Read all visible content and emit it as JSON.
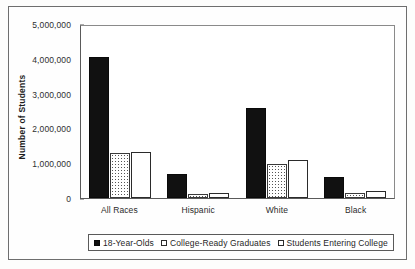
{
  "chart_data": {
    "type": "bar",
    "title": "",
    "subtitle": "",
    "xlabel": "",
    "ylabel": "Number of Students",
    "ylim": [
      0,
      5000000
    ],
    "ytick_labels": [
      "5,000,000",
      "4,000,000",
      "3,000,000",
      "2,000,000",
      "1,000,000",
      "0"
    ],
    "ytick_values": [
      5000000,
      4000000,
      3000000,
      2000000,
      1000000,
      0
    ],
    "grid": false,
    "legend_position": "bottom",
    "categories": [
      "All Races",
      "Hispanic",
      "White",
      "Black"
    ],
    "series": [
      {
        "name": "18-Year-Olds",
        "fill": "solid-black",
        "color": "#111111",
        "values": [
          4050000,
          680000,
          2600000,
          600000
        ]
      },
      {
        "name": "College-Ready Graduates",
        "fill": "stippled-gray",
        "color": "#c8c8c8",
        "values": [
          1300000,
          120000,
          980000,
          130000
        ]
      },
      {
        "name": "Students Entering College",
        "fill": "white-outline",
        "color": "#ffffff",
        "values": [
          1330000,
          150000,
          1080000,
          200000
        ]
      }
    ]
  },
  "legend": {
    "items": [
      {
        "label": "18-Year-Olds"
      },
      {
        "label": "College-Ready Graduates"
      },
      {
        "label": "Students Entering College"
      }
    ]
  }
}
